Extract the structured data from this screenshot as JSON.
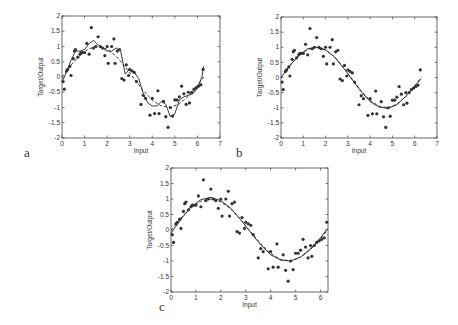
{
  "chart_data": [
    {
      "id": "a",
      "type": "line",
      "panel_label": "a",
      "xlabel": "Input",
      "ylabel": "Target/Output",
      "xlim": [
        0,
        7
      ],
      "ylim": [
        -2,
        2
      ],
      "xticks": [
        0,
        1,
        2,
        3,
        4,
        5,
        6,
        7
      ],
      "yticks": [
        -2,
        -1.5,
        -1,
        -0.5,
        0,
        0.5,
        1,
        1.5,
        2
      ],
      "grid": false,
      "series": [
        {
          "name": "network output",
          "style": "solid",
          "x": [
            0,
            0.2,
            0.4,
            0.6,
            0.8,
            1.0,
            1.2,
            1.4,
            1.6,
            1.8,
            2.0,
            2.2,
            2.4,
            2.6,
            2.8,
            3.0,
            3.2,
            3.4,
            3.6,
            3.8,
            4.0,
            4.2,
            4.4,
            4.6,
            4.8,
            5.0,
            5.2,
            5.4,
            5.6,
            5.8,
            6.0,
            6.2,
            6.28
          ],
          "y": [
            -0.15,
            0.15,
            0.55,
            0.85,
            0.85,
            0.9,
            1.1,
            1.2,
            1.05,
            0.95,
            0.85,
            0.85,
            0.95,
            0.85,
            0.1,
            0.25,
            0.15,
            -0.05,
            -0.55,
            -0.85,
            -0.95,
            -0.95,
            -0.8,
            -0.9,
            -1.3,
            -1.2,
            -0.75,
            -0.65,
            -0.6,
            -0.55,
            -0.35,
            0.0,
            0.35
          ]
        },
        {
          "name": "target function",
          "style": "dashed",
          "x": [
            0,
            0.4,
            0.8,
            1.2,
            1.6,
            2.0,
            2.4,
            2.8,
            3.2,
            3.6,
            4.0,
            4.4,
            4.8,
            5.2,
            5.6,
            6.0,
            6.28
          ],
          "y": [
            0.0,
            0.39,
            0.72,
            0.93,
            1.0,
            0.91,
            0.68,
            0.33,
            -0.06,
            -0.44,
            -0.76,
            -0.95,
            -1.0,
            -0.88,
            -0.63,
            -0.28,
            0.0
          ]
        }
      ]
    },
    {
      "id": "b",
      "type": "line",
      "panel_label": "b",
      "xlabel": "Input",
      "ylabel": "Target/Output",
      "xlim": [
        0,
        7
      ],
      "ylim": [
        -2,
        2
      ],
      "xticks": [
        0,
        1,
        2,
        3,
        4,
        5,
        6,
        7
      ],
      "yticks": [
        -2,
        -1.5,
        -1,
        -0.5,
        0,
        0.5,
        1,
        1.5,
        2
      ],
      "grid": false,
      "series": [
        {
          "name": "network output",
          "style": "solid",
          "x": [
            0,
            0.4,
            0.8,
            1.2,
            1.6,
            2.0,
            2.4,
            2.8,
            3.2,
            3.6,
            4.0,
            4.4,
            4.8,
            5.2,
            5.6,
            6.0,
            6.28
          ],
          "y": [
            0.0,
            0.4,
            0.73,
            0.95,
            1.0,
            0.92,
            0.68,
            0.32,
            -0.08,
            -0.47,
            -0.8,
            -0.98,
            -1.02,
            -0.9,
            -0.62,
            -0.28,
            -0.05
          ]
        },
        {
          "name": "target function",
          "style": "dashed",
          "x": [
            0,
            0.4,
            0.8,
            1.2,
            1.6,
            2.0,
            2.4,
            2.8,
            3.2,
            3.6,
            4.0,
            4.4,
            4.8,
            5.2,
            5.6,
            6.0,
            6.28
          ],
          "y": [
            0.0,
            0.39,
            0.72,
            0.93,
            1.0,
            0.91,
            0.68,
            0.33,
            -0.06,
            -0.44,
            -0.76,
            -0.95,
            -1.0,
            -0.88,
            -0.63,
            -0.28,
            0.0
          ]
        }
      ]
    },
    {
      "id": "c",
      "type": "line",
      "panel_label": "c",
      "xlabel": "Input",
      "ylabel": "Target/Output",
      "xlim": [
        0,
        6.3
      ],
      "ylim": [
        -2,
        2
      ],
      "xticks": [
        0,
        1,
        2,
        3,
        4,
        5,
        6
      ],
      "yticks": [
        -2,
        -1.5,
        -1,
        -0.5,
        0,
        0.5,
        1,
        1.5,
        2
      ],
      "grid": false,
      "series": [
        {
          "name": "network output",
          "style": "solid",
          "x": [
            0,
            0.4,
            0.8,
            1.2,
            1.6,
            2.0,
            2.4,
            2.8,
            3.2,
            3.6,
            4.0,
            4.4,
            4.8,
            5.2,
            5.6,
            6.0,
            6.28
          ],
          "y": [
            -0.1,
            0.35,
            0.74,
            0.98,
            1.05,
            0.95,
            0.7,
            0.33,
            -0.08,
            -0.48,
            -0.8,
            -0.97,
            -1.0,
            -0.87,
            -0.6,
            -0.25,
            0.05
          ]
        },
        {
          "name": "target function",
          "style": "dashed",
          "x": [
            0,
            0.4,
            0.8,
            1.2,
            1.6,
            2.0,
            2.4,
            2.8,
            3.2,
            3.6,
            4.0,
            4.4,
            4.8,
            5.2,
            5.6,
            6.0,
            6.28
          ],
          "y": [
            0.0,
            0.39,
            0.72,
            0.93,
            1.0,
            0.91,
            0.68,
            0.33,
            -0.06,
            -0.44,
            -0.76,
            -0.95,
            -1.0,
            -0.88,
            -0.63,
            -0.28,
            0.0
          ]
        }
      ]
    }
  ],
  "training_points": {
    "x": [
      0.05,
      0.1,
      0.2,
      0.25,
      0.35,
      0.4,
      0.5,
      0.55,
      0.6,
      0.7,
      0.8,
      0.85,
      0.9,
      1.0,
      1.1,
      1.2,
      1.3,
      1.4,
      1.5,
      1.6,
      1.7,
      1.8,
      1.9,
      2.0,
      2.05,
      2.2,
      2.3,
      2.35,
      2.45,
      2.55,
      2.65,
      2.75,
      2.85,
      2.95,
      3.0,
      3.1,
      3.2,
      3.3,
      3.5,
      3.6,
      3.7,
      3.9,
      4.0,
      4.1,
      4.25,
      4.3,
      4.5,
      4.6,
      4.7,
      4.8,
      4.9,
      5.0,
      5.1,
      5.2,
      5.3,
      5.4,
      5.5,
      5.6,
      5.65,
      5.75,
      5.85,
      5.95,
      6.05,
      6.15,
      6.25
    ],
    "y": [
      -0.15,
      -0.4,
      0.2,
      0.25,
      0.35,
      0.05,
      0.6,
      0.85,
      0.9,
      0.65,
      0.75,
      0.8,
      0.8,
      0.8,
      1.1,
      0.75,
      1.62,
      0.95,
      1.0,
      1.32,
      1.0,
      0.95,
      0.7,
      1.0,
      0.45,
      1.0,
      1.25,
      0.45,
      0.85,
      0.9,
      -0.05,
      -0.1,
      0.4,
      0.05,
      0.25,
      0.2,
      0.15,
      -0.15,
      -0.9,
      -0.6,
      -0.7,
      -1.25,
      -0.7,
      -1.2,
      -0.45,
      -1.2,
      -0.8,
      -1.3,
      -1.65,
      -1.0,
      -1.28,
      -0.75,
      -0.75,
      -0.65,
      -0.3,
      -0.55,
      -0.9,
      -0.5,
      -0.85,
      -0.5,
      -0.4,
      -0.35,
      -0.3,
      -0.25,
      0.25
    ]
  },
  "layout": [
    {
      "left": 62,
      "top": 16,
      "right": 220,
      "bottom": 138,
      "label_x": 24,
      "label_y": 145
    },
    {
      "left": 281,
      "top": 17,
      "right": 437,
      "bottom": 138,
      "label_x": 236,
      "label_y": 145
    },
    {
      "left": 171,
      "top": 168,
      "right": 328,
      "bottom": 292,
      "label_x": 159,
      "label_y": 299
    }
  ]
}
